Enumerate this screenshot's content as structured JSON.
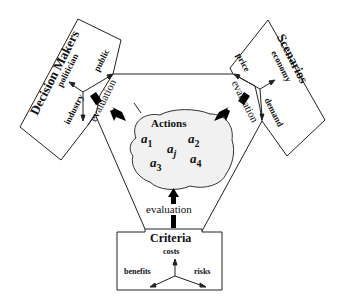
{
  "center": {
    "title": "Actions",
    "items": [
      {
        "base": "a",
        "sub": "1"
      },
      {
        "base": "a",
        "sub": "2"
      },
      {
        "base": "a",
        "sub": "j"
      },
      {
        "base": "a",
        "sub": "3"
      },
      {
        "base": "a",
        "sub": "4"
      }
    ],
    "fill": "#f1f1f1"
  },
  "decision_makers": {
    "title": "Decision Makers",
    "axes": [
      "politician",
      "public",
      "industry"
    ],
    "arrow_label": "evaluation"
  },
  "scenarios": {
    "title": "Scenarios",
    "axes": [
      "price",
      "economy",
      "demand"
    ],
    "arrow_label": "evaluation"
  },
  "criteria": {
    "title": "Criteria",
    "axes": [
      "costs",
      "benefits",
      "risks"
    ],
    "arrow_label": "evaluation"
  },
  "colors": {
    "line": "#222222",
    "arrow": "#000000",
    "background": "#ffffff"
  }
}
